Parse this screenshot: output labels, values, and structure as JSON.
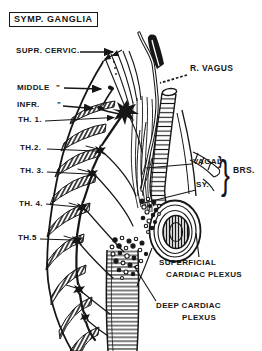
{
  "figure": {
    "title": "SYMP. GANGLIA",
    "labels": {
      "supr_cervic": "SUPR. CERVIC.",
      "middle": "MIDDLE",
      "middle_ditto": "\"",
      "infr": "INFR.",
      "infr_ditto": "\"",
      "th1": "TH. 1.",
      "th2": "TH.2.",
      "th3": "TH. 3.",
      "th4": "TH. 4.",
      "th5": "TH.5",
      "r_vagus": "R. VAGUS",
      "vagal": "VAGAL",
      "vagal_brace": "}",
      "group_brace": "}",
      "brs": "BRS.",
      "sy": "SY.",
      "superficial_1": "SUPERFICIAL",
      "superficial_2": "CARDIAC PLEXUS",
      "deep_1": "DEEP CARDIAC",
      "deep_2": "PLEXUS"
    },
    "colors": {
      "ink": "#161616",
      "paper": "#ffffff"
    }
  }
}
